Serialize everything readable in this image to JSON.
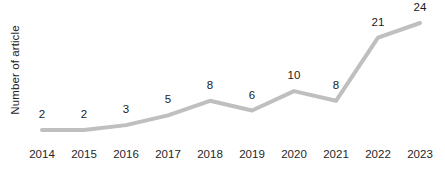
{
  "chart_data": {
    "type": "line",
    "title": "",
    "subtitle": "",
    "xlabel": "",
    "ylabel": "Number of article",
    "categories": [
      "2014",
      "2015",
      "2016",
      "2017",
      "2018",
      "2019",
      "2020",
      "2021",
      "2022",
      "2023"
    ],
    "values": [
      2,
      2,
      3,
      5,
      8,
      6,
      10,
      8,
      21,
      24
    ],
    "point_labels": [
      "2",
      "2",
      "3",
      "5",
      "8",
      "6",
      "10",
      "8",
      "21",
      "24"
    ],
    "series": [
      {
        "name": "Number of article",
        "values": [
          2,
          2,
          3,
          5,
          8,
          6,
          10,
          8,
          21,
          24
        ]
      }
    ],
    "ylim": [
      0,
      26
    ],
    "xlim_categories": [
      "2014",
      "2023"
    ],
    "grid": false,
    "axis_lines": false,
    "data_labels_shown": true,
    "data_label_position": "above",
    "legend": false,
    "legend_position": "none",
    "markers": false,
    "line_color": "#bfbfbf",
    "line_width_px": 4,
    "label_color": "#1a1a1a",
    "axis_text_color": "#262626",
    "background_color": "#ffffff"
  }
}
